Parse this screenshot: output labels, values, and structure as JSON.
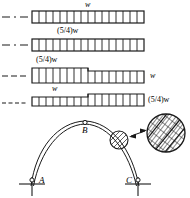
{
  "figure": {
    "background_color": "#ffffff",
    "line_color": "#1a1a1a",
    "width_px": 190,
    "height_px": 198
  },
  "courses": [
    {
      "index": 1,
      "label_top": "w",
      "label_top_position": "center-above",
      "label_right": "",
      "leader": "dash-dot",
      "cells": 16,
      "stepped": false,
      "note": "uniform course"
    },
    {
      "index": 2,
      "label_top": "(5/4)w",
      "label_top_position": "center-above",
      "label_right": "",
      "leader": "dash-dot",
      "cells": 16,
      "stepped": false,
      "note": "uniform course"
    },
    {
      "index": 3,
      "label_top": "(5/4)w",
      "label_top_position": "left-above",
      "label_right": "w",
      "leader": "dashed",
      "cells_left": 8,
      "cells_right": 8,
      "stepped": true,
      "note": "left half taller cells, right half shorter cells"
    },
    {
      "index": 4,
      "label_top": "w",
      "label_top_position": "left-above",
      "label_right": "(5/4)w",
      "leader": "dotted",
      "cells_left": 8,
      "cells_right": 8,
      "stepped": true,
      "note": "left half shorter cells, right half taller cells"
    }
  ],
  "arch": {
    "points": [
      {
        "name": "A",
        "label": "A",
        "role": "left-support",
        "marker": "open-circle"
      },
      {
        "name": "B",
        "label": "B",
        "role": "crown",
        "marker": "open-circle"
      },
      {
        "name": "C",
        "label": "C",
        "role": "right-support",
        "marker": "open-circle"
      }
    ],
    "supports": [
      "left-ground-hatch",
      "right-ground-hatch"
    ],
    "curve_count": 2,
    "detail": {
      "callout_circle": "small-circle-on-arch",
      "magnified_circle": "hatched-brick-detail",
      "arrow": "double-headed",
      "pattern": "diagonal-hatched-bricks"
    }
  }
}
